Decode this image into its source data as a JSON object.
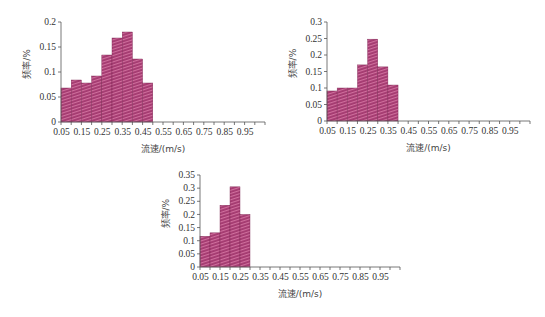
{
  "bar_pattern": {
    "base_color": "#a43a70",
    "stripe_color": "#cf6f9d",
    "edge_color": "#7a2550"
  },
  "chart_data": [
    {
      "type": "bar",
      "title": "",
      "xlabel": "流速/(m/s)",
      "ylabel": "频率/%",
      "x_tick_labels": [
        "0.05",
        "0.15",
        "0.25",
        "0.35",
        "0.45",
        "0.55",
        "0.65",
        "0.75",
        "0.85",
        "0.95"
      ],
      "bin_width": 0.05,
      "bin_starts": [
        0.05,
        0.1,
        0.15,
        0.2,
        0.25,
        0.3,
        0.35,
        0.4,
        0.45
      ],
      "values": [
        0.068,
        0.084,
        0.078,
        0.092,
        0.134,
        0.168,
        0.18,
        0.126,
        0.078
      ],
      "y_ticks": [
        0,
        0.05,
        0.1,
        0.15,
        0.2
      ],
      "y_tick_labels": [
        "0",
        "0.05",
        "0.1",
        "0.15",
        "0.2"
      ],
      "xlim": [
        0.05,
        1.05
      ],
      "ylim": [
        0,
        0.2
      ],
      "grid": false,
      "legend": null,
      "layout": {
        "left": 61,
        "top": 22,
        "plot_w": 204,
        "plot_h": 100
      }
    },
    {
      "type": "bar",
      "title": "",
      "xlabel": "流速/(m/s)",
      "ylabel": "频率/%",
      "x_tick_labels": [
        "0.05",
        "0.15",
        "0.25",
        "0.35",
        "0.45",
        "0.55",
        "0.65",
        "0.75",
        "0.85",
        "0.95"
      ],
      "bin_width": 0.05,
      "bin_starts": [
        0.05,
        0.1,
        0.15,
        0.2,
        0.25,
        0.3,
        0.35
      ],
      "values": [
        0.091,
        0.1,
        0.1,
        0.17,
        0.248,
        0.164,
        0.109
      ],
      "y_ticks": [
        0,
        0.05,
        0.1,
        0.15,
        0.2,
        0.25,
        0.3
      ],
      "y_tick_labels": [
        "0",
        "0.05",
        "0.1",
        "0.15",
        "0.2",
        "0.25",
        "0.3"
      ],
      "xlim": [
        0.05,
        1.05
      ],
      "ylim": [
        0,
        0.3
      ],
      "grid": false,
      "legend": null,
      "layout": {
        "left": 327,
        "top": 22,
        "plot_w": 203,
        "plot_h": 99
      }
    },
    {
      "type": "bar",
      "title": "",
      "xlabel": "流速/(m/s)",
      "ylabel": "频率/%",
      "x_tick_labels": [
        "0.05",
        "0.15",
        "0.25",
        "0.35",
        "0.45",
        "0.55",
        "0.65",
        "0.75",
        "0.85",
        "0.95"
      ],
      "bin_width": 0.05,
      "bin_starts": [
        0.05,
        0.1,
        0.15,
        0.2,
        0.25
      ],
      "values": [
        0.117,
        0.13,
        0.235,
        0.305,
        0.2
      ],
      "y_ticks": [
        0,
        0.05,
        0.1,
        0.15,
        0.2,
        0.25,
        0.3,
        0.35
      ],
      "y_tick_labels": [
        "0",
        "0.05",
        "0.1",
        "0.15",
        "0.2",
        "0.25",
        "0.3",
        "0.35"
      ],
      "xlim": [
        0.05,
        1.05
      ],
      "ylim": [
        0,
        0.35
      ],
      "grid": false,
      "legend": null,
      "layout": {
        "left": 200,
        "top": 175,
        "plot_w": 200,
        "plot_h": 92
      }
    }
  ]
}
